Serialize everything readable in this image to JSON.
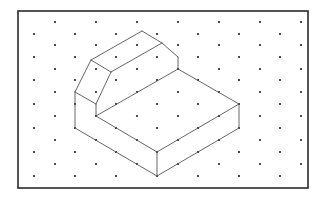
{
  "diagram": {
    "type": "isometric-drawing",
    "colors": {
      "background": "#ffffff",
      "frame": "#2a2a2a",
      "dots": "#222222",
      "edges": "#555555"
    },
    "frame": {
      "x": 18,
      "y": 11,
      "width": 290,
      "height": 177
    },
    "grid": {
      "row_ys": [
        22,
        34,
        45,
        57,
        69,
        80,
        92,
        104,
        116,
        128,
        140,
        152,
        164,
        176
      ],
      "odd_row_xs": [
        55,
        96,
        137,
        178,
        219,
        260,
        301
      ],
      "even_row_xs": [
        34,
        75,
        116,
        157,
        198,
        239,
        280
      ],
      "dot_radius": 1.1
    },
    "edges": [
      [
        142,
        31,
        162,
        43
      ],
      [
        142,
        31,
        91,
        60
      ],
      [
        162,
        43,
        111,
        72
      ],
      [
        162,
        43,
        178,
        57
      ],
      [
        178,
        57,
        178,
        69
      ],
      [
        91,
        60,
        111,
        72
      ],
      [
        91,
        60,
        75,
        92
      ],
      [
        111,
        72,
        96,
        104
      ],
      [
        75,
        92,
        96,
        104
      ],
      [
        96,
        104,
        96,
        116
      ],
      [
        178,
        69,
        96,
        116
      ],
      [
        178,
        69,
        239,
        104
      ],
      [
        96,
        116,
        157,
        152
      ],
      [
        75,
        92,
        75,
        128
      ],
      [
        75,
        128,
        157,
        176
      ],
      [
        157,
        152,
        157,
        176
      ],
      [
        157,
        152,
        239,
        104
      ],
      [
        157,
        176,
        239,
        128
      ],
      [
        239,
        104,
        239,
        128
      ]
    ]
  }
}
